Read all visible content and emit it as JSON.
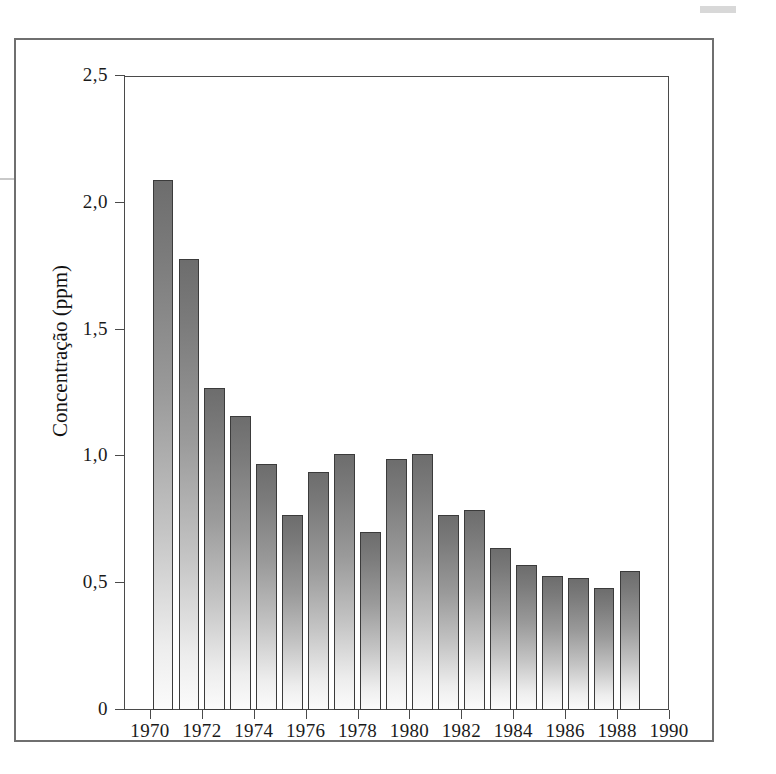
{
  "figure": {
    "decimal_separator": ",",
    "ink_color": "#3b3b3b",
    "bar_fill_dark": "#6d6d6d",
    "bar_fill_light": "#fbfbfb"
  },
  "chart_data": {
    "type": "bar",
    "title": "",
    "xlabel": "",
    "ylabel": "Concentração (ppm)",
    "ylim": [
      0,
      2.5
    ],
    "xlim": [
      1969,
      1990
    ],
    "grid": false,
    "legend": null,
    "ytick_labels": [
      "2,5",
      "2,0",
      "1,5",
      "1,0",
      "0,5",
      "0"
    ],
    "ytick_values": [
      2.5,
      2.0,
      1.5,
      1.0,
      0.5,
      0
    ],
    "xtick_labels": [
      "1970",
      "1972",
      "1974",
      "1976",
      "1978",
      "1980",
      "1982",
      "1984",
      "1986",
      "1988",
      "1990"
    ],
    "xtick_values": [
      1970,
      1972,
      1974,
      1976,
      1978,
      1980,
      1982,
      1984,
      1986,
      1988,
      1990
    ],
    "categories": [
      1970,
      1971,
      1972,
      1973,
      1974,
      1975,
      1976,
      1977,
      1978,
      1979,
      1980,
      1981,
      1982,
      1983,
      1984,
      1985,
      1986,
      1987,
      1988
    ],
    "values": [
      2.09,
      1.78,
      1.27,
      1.16,
      0.97,
      0.77,
      0.94,
      1.01,
      0.7,
      0.99,
      1.01,
      0.77,
      0.79,
      0.64,
      0.57,
      0.53,
      0.52,
      0.48,
      0.55
    ]
  }
}
